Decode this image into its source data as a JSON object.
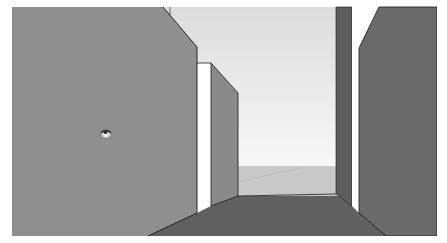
{
  "app": {
    "view": "3D model viewport - corridor walkthrough",
    "tool_cursor": "look-around-eye-icon"
  },
  "scene": {
    "frame": {
      "x": 12,
      "y": 7,
      "width": 425,
      "height": 229
    },
    "colors": {
      "border": "#ffffff",
      "left_wall": "#8f8f8f",
      "inner_left_wall": "#8a8a8a",
      "right_pillar": "#5e5e5e",
      "right_wall": "#6a6a6a",
      "floor": "#606060",
      "sky_top": "#dcdcdc",
      "sky_bottom": "#f6f6f6",
      "ground": "#c9c9c9",
      "doorway_light": "#ffffff",
      "edge": "#1a1a1a"
    },
    "cursor": {
      "x": 106,
      "y": 133
    }
  }
}
